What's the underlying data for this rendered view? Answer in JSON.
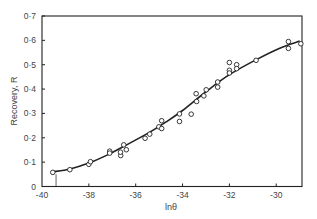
{
  "chart_data": {
    "type": "scatter",
    "title": "",
    "xlabel": "lnθ",
    "ylabel": "Recovery, R",
    "xlim": [
      -40,
      -28.9
    ],
    "ylim": [
      0,
      0.7
    ],
    "grid": false,
    "legend": null,
    "x_ticks": [
      -40,
      -38,
      -36,
      -34,
      -32,
      -30
    ],
    "x_tick_labels": [
      "-40",
      "-38",
      "-36",
      "-34",
      "-32",
      "-30"
    ],
    "y_ticks": [
      0,
      0.1,
      0.2,
      0.3,
      0.4,
      0.5,
      0.6,
      0.7
    ],
    "y_tick_labels": [
      "0",
      "0·1",
      "0·2",
      "0·3",
      "0·4",
      "0·5",
      "0·6",
      "0·7"
    ],
    "series": [
      {
        "name": "measured",
        "marker": "open-circle",
        "x": [
          -39.54,
          -38.81,
          -38.0,
          -37.93,
          -37.11,
          -37.11,
          -36.64,
          -36.65,
          -36.51,
          -36.4,
          -35.6,
          -35.4,
          -35.01,
          -34.89,
          -34.89,
          -34.13,
          -34.13,
          -33.63,
          -33.42,
          -33.4,
          -33.09,
          -32.99,
          -32.5,
          -32.5,
          -32.0,
          -32.0,
          -32.0,
          -31.69,
          -31.69,
          -30.86,
          -29.48,
          -29.48,
          -28.95
        ],
        "y": [
          0.058,
          0.069,
          0.091,
          0.102,
          0.145,
          0.137,
          0.127,
          0.141,
          0.171,
          0.151,
          0.198,
          0.215,
          0.245,
          0.27,
          0.238,
          0.298,
          0.267,
          0.297,
          0.381,
          0.349,
          0.372,
          0.397,
          0.429,
          0.408,
          0.509,
          0.477,
          0.466,
          0.5,
          0.484,
          0.518,
          0.595,
          0.567,
          0.586
        ]
      },
      {
        "name": "fitted curve",
        "type": "line",
        "x": [
          -39.55,
          -38.8,
          -38.0,
          -37.2,
          -36.6,
          -35.45,
          -34.7,
          -34.0,
          -33.0,
          -32.0,
          -30.85,
          -29.9,
          -29.0
        ],
        "y": [
          0.06,
          0.072,
          0.096,
          0.13,
          0.16,
          0.22,
          0.265,
          0.312,
          0.389,
          0.459,
          0.521,
          0.566,
          0.597
        ]
      }
    ],
    "annotations": [
      {
        "type": "vertical-marker",
        "x": -39.4,
        "y_from": 0,
        "y_to": 0.05
      }
    ]
  },
  "colors": {
    "ink": "#222222",
    "marker_fill": "#ffffff",
    "background": "#ffffff"
  }
}
